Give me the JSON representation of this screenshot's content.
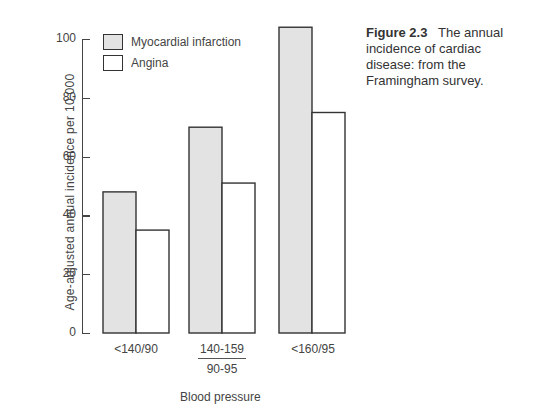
{
  "caption": {
    "figure_label": "Figure 2.3",
    "text": "The annual incidence of cardiac disease: from the Framingham survey."
  },
  "colors": {
    "mi_fill": "#e3e3e3",
    "angina_fill": "#ffffff",
    "stroke": "#333333"
  },
  "chart_data": {
    "type": "bar",
    "title": "The annual incidence of cardiac disease: from the Framingham survey",
    "xlabel": "Blood pressure",
    "ylabel": "Age-adjusted annual incidence per 10,000",
    "categories": [
      "<140/90",
      "140-159 / 90-95",
      "<160/95"
    ],
    "series": [
      {
        "name": "Myocardial infarction",
        "values": [
          48,
          70,
          104
        ]
      },
      {
        "name": "Angina",
        "values": [
          35,
          51,
          75
        ]
      }
    ],
    "ylim": [
      0,
      100
    ],
    "yticks": [
      0,
      20,
      40,
      60,
      80,
      100
    ],
    "grid": false,
    "legend_position": "top-left inside"
  },
  "labels": {
    "cat0": "<140/90",
    "cat1_top": "140-159",
    "cat1_bottom": "90-95",
    "cat2": "<160/95",
    "xlabel": "Blood pressure",
    "ylabel": "Age-adjusted annual incidence per 10,000",
    "legend_mi": "Myocardial infarction",
    "legend_angina": "Angina",
    "ticks": [
      "0",
      "20",
      "40",
      "60",
      "80",
      "100"
    ]
  }
}
